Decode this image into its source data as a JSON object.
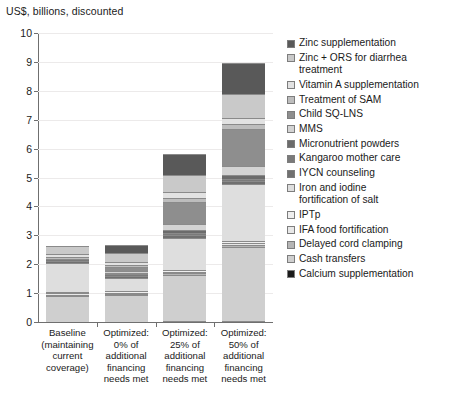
{
  "chart_data": {
    "type": "bar",
    "subtype": "stacked-bar",
    "title": "",
    "ylabel": "US$, billions, discounted",
    "xlabel": "",
    "ylim": [
      0,
      10
    ],
    "ytick_labels": [
      "0",
      "1",
      "2",
      "3",
      "4",
      "5",
      "6",
      "7",
      "8",
      "9",
      "10"
    ],
    "ytick_values": [
      0,
      1,
      2,
      3,
      4,
      5,
      6,
      7,
      8,
      9,
      10
    ],
    "grid": true,
    "legend_position": "right",
    "categories": [
      "Baseline\n(maintaining\ncurrent\ncoverage)",
      "Optimized:\n0% of\nadditional\nfinancing\nneeds met",
      "Optimized:\n25% of\nadditional\nfinancing\nneeds met",
      "Optimized:\n50% of\nadditional\nfinancing\nneeds met"
    ],
    "totals": [
      2.65,
      2.67,
      5.82,
      8.98
    ],
    "series": [
      {
        "name": "Zinc supplementation",
        "color": "#595959",
        "values": [
          0.0,
          0.28,
          0.73,
          1.1
        ]
      },
      {
        "name": "Zinc + ORS for diarrhea\ntreatment",
        "color": "#c9c9c9",
        "values": [
          0.3,
          0.32,
          0.6,
          0.82
        ]
      },
      {
        "name": "Vitamin A supplementation",
        "color": "#e2e2e2",
        "values": [
          0.1,
          0.09,
          0.2,
          0.22
        ]
      },
      {
        "name": "Treatment of SAM",
        "color": "#bdbdbd",
        "values": [
          0.08,
          0.07,
          0.12,
          0.15
        ]
      },
      {
        "name": "Child SQ-LNS",
        "color": "#8e8e8e",
        "values": [
          0.0,
          0.14,
          0.78,
          1.3
        ]
      },
      {
        "name": "MMS",
        "color": "#d3d3d3",
        "values": [
          0.0,
          0.06,
          0.22,
          0.3
        ]
      },
      {
        "name": "Micronutrient powders",
        "color": "#6b6b6b",
        "values": [
          0.0,
          0.05,
          0.1,
          0.14
        ]
      },
      {
        "name": "Kangaroo mother care",
        "color": "#7a7a7a",
        "values": [
          0.05,
          0.05,
          0.06,
          0.07
        ]
      },
      {
        "name": "IYCN counseling",
        "color": "#707070",
        "values": [
          0.09,
          0.09,
          0.1,
          0.11
        ]
      },
      {
        "name": "Iron and iodine\nfortification of salt",
        "color": "#dedede",
        "values": [
          0.98,
          0.46,
          1.1,
          1.96
        ]
      },
      {
        "name": "IPTp",
        "color": "#efefef",
        "values": [
          0.06,
          0.05,
          0.07,
          0.08
        ]
      },
      {
        "name": "IFA food fortification",
        "color": "#e8e8e8",
        "values": [
          0.05,
          0.05,
          0.06,
          0.07
        ]
      },
      {
        "name": "Delayed cord clamping",
        "color": "#b5b5b5",
        "values": [
          0.04,
          0.04,
          0.05,
          0.06
        ]
      },
      {
        "name": "Cash transfers",
        "color": "#cfcfcf",
        "values": [
          0.9,
          0.92,
          1.58,
          2.55
        ]
      },
      {
        "name": "Calcium supplementation",
        "color": "#1a1a1a",
        "values": [
          0.0,
          0.0,
          0.05,
          0.05
        ]
      }
    ]
  }
}
